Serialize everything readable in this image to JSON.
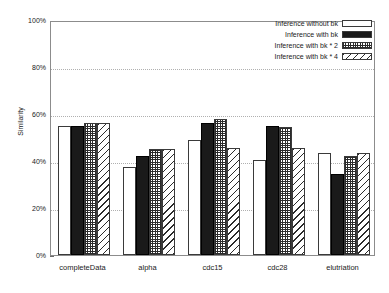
{
  "chart_data": {
    "type": "bar",
    "title": "",
    "xlabel": "",
    "ylabel": "Similarity",
    "ylim": [
      0,
      100
    ],
    "ytick_labels": [
      "0%",
      "20%",
      "40%",
      "60%",
      "80%",
      "100%"
    ],
    "ytick_values": [
      0,
      20,
      40,
      60,
      80,
      100
    ],
    "grid": true,
    "legend_position": "top-right",
    "categories": [
      "completeData",
      "alpha",
      "cdc15",
      "cdc28",
      "elutriation"
    ],
    "series": [
      {
        "name": "Inference without bk",
        "pattern": "empty",
        "values": [
          55.0,
          37.4,
          48.9,
          40.4,
          43.4
        ]
      },
      {
        "name": "Inference with bk",
        "pattern": "solid",
        "values": [
          54.9,
          42.3,
          56.0,
          55.1,
          34.3
        ]
      },
      {
        "name": "Inference with bk * 2",
        "pattern": "crosshatch",
        "values": [
          56.1,
          45.2,
          57.7,
          54.6,
          42.3
        ]
      },
      {
        "name": "Inference with bk * 4",
        "pattern": "diagonal",
        "values": [
          56.1,
          45.2,
          45.6,
          45.4,
          43.3
        ]
      }
    ]
  },
  "colors": {
    "axis": "#8c8c8c",
    "grid": "#b0b0b0",
    "text": "#1a1a1a",
    "bar_outline": "#3a3a3a",
    "bar_solid": "#1a1a1a",
    "background": "#ffffff"
  }
}
